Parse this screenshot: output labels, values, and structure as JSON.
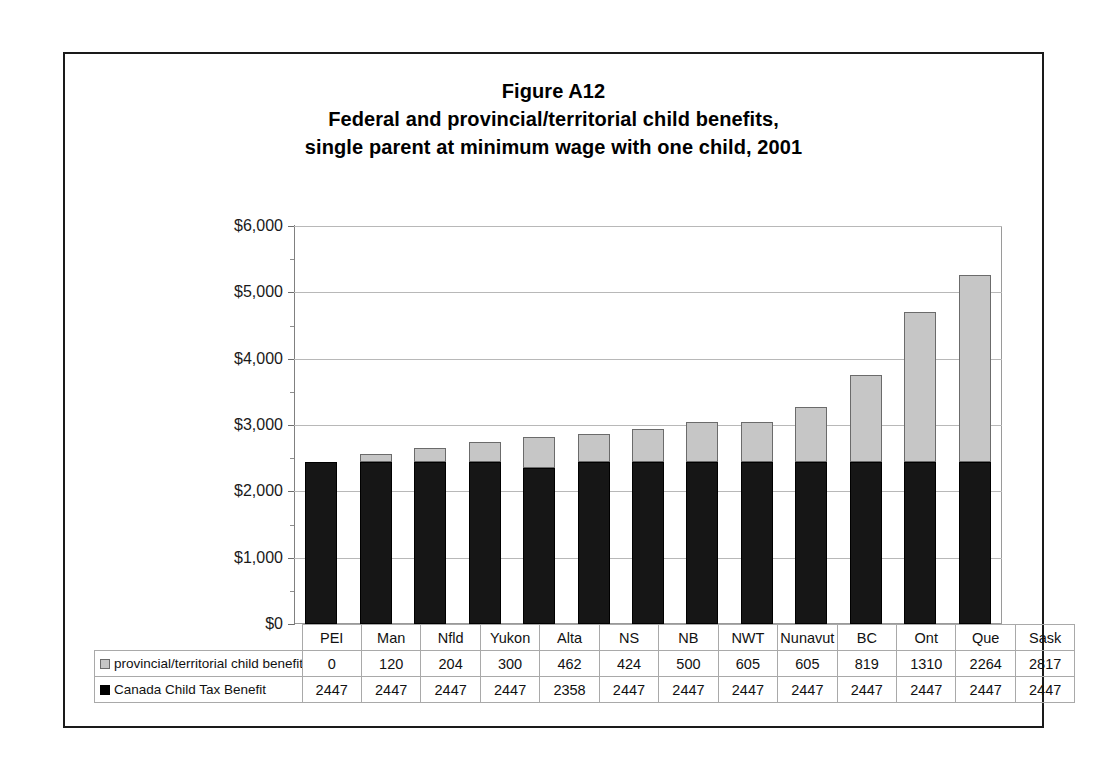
{
  "figure": {
    "number": "Figure A12",
    "title_line_1": "Federal and provincial/territorial child benefits,",
    "title_line_2": "single parent at minimum wage with one child, 2001"
  },
  "legend": {
    "series_top_label": "provincial/territorial child benefits",
    "series_bottom_label": "Canada Child Tax Benefit",
    "series_top_swatch": "light-gray-square-icon",
    "series_bottom_swatch": "black-square-icon"
  },
  "axis": {
    "y_tick_labels": [
      "$0",
      "$1,000",
      "$2,000",
      "$3,000",
      "$4,000",
      "$5,000",
      "$6,000"
    ]
  },
  "colors": {
    "series_top": "#c6c6c6",
    "series_top_border": "#6b6b6b",
    "series_bottom": "#161616",
    "gridline": "#b8b8b8",
    "frame": "#1a1a1a",
    "table_border": "#a9a9a9",
    "background": "#ffffff"
  },
  "chart_data": {
    "type": "bar",
    "subtype": "stacked-column",
    "xlabel": "",
    "ylabel": "",
    "ylim": [
      0,
      6000
    ],
    "ytick_step": 1000,
    "ytick_values": [
      0,
      1000,
      2000,
      3000,
      4000,
      5000,
      6000
    ],
    "ytick_labels": [
      "$0",
      "$1,000",
      "$2,000",
      "$3,000",
      "$4,000",
      "$5,000",
      "$6,000"
    ],
    "grid": true,
    "legend_position": "table-row-headers",
    "categories": [
      "PEI",
      "Man",
      "Nfld",
      "Yukon",
      "Alta",
      "NS",
      "NB",
      "NWT",
      "Nunavut",
      "BC",
      "Ont",
      "Que",
      "Sask"
    ],
    "series": [
      {
        "name": "Canada Child Tax Benefit",
        "stack_order": "bottom",
        "color": "#161616",
        "values": [
          2447,
          2447,
          2447,
          2447,
          2358,
          2447,
          2447,
          2447,
          2447,
          2447,
          2447,
          2447,
          2447
        ]
      },
      {
        "name": "provincial/territorial child benefits",
        "stack_order": "top",
        "color": "#c6c6c6",
        "values": [
          0,
          120,
          204,
          300,
          462,
          424,
          500,
          605,
          605,
          819,
          1310,
          2264,
          2817
        ]
      }
    ],
    "totals": [
      2447,
      2567,
      2651,
      2747,
      2820,
      2871,
      2947,
      3052,
      3052,
      3266,
      3757,
      4711,
      5264
    ]
  }
}
